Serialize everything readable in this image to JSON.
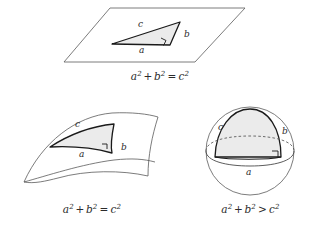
{
  "figure": {
    "background": "#ffffff",
    "stroke_color": "#4a4a4a",
    "triangle_stroke": "#1a1a1a",
    "triangle_fill": "#ebebeb",
    "label_color": "#2b2b2b",
    "width": 316,
    "height": 228
  },
  "panels": {
    "euclidean": {
      "name": "flat-plane",
      "surface": "parallelogram-plane",
      "labels": {
        "hypotenuse": "c",
        "vertical_leg": "b",
        "horizontal_leg": "a"
      },
      "right_angle_marker": true,
      "caption": {
        "lhs_first": "a",
        "lhs_first_exp": "2",
        "plus": "+",
        "lhs_second": "b",
        "lhs_second_exp": "2",
        "operator": "=",
        "rhs": "c",
        "rhs_exp": "2",
        "full_text": "a2 + b2 = c2"
      }
    },
    "hyperbolic": {
      "name": "saddle-surface",
      "surface": "hyperbolic-saddle",
      "labels": {
        "hypotenuse": "c",
        "vertical_leg": "b",
        "horizontal_leg": "a"
      },
      "right_angle_marker": true,
      "caption": {
        "lhs_first": "a",
        "lhs_first_exp": "2",
        "plus": "+",
        "lhs_second": "b",
        "lhs_second_exp": "2",
        "operator": "=",
        "rhs": "c",
        "rhs_exp": "2",
        "full_text": "a2 + b2 = c2"
      }
    },
    "spherical": {
      "name": "sphere-surface",
      "surface": "sphere",
      "labels": {
        "hypotenuse": "c",
        "vertical_leg": "b",
        "horizontal_leg": "a"
      },
      "right_angle_marker": true,
      "caption": {
        "lhs_first": "a",
        "lhs_first_exp": "2",
        "plus": "+",
        "lhs_second": "b",
        "lhs_second_exp": "2",
        "operator": ">",
        "rhs": "c",
        "rhs_exp": "2",
        "full_text": "a2 + b2 > c2"
      }
    }
  }
}
